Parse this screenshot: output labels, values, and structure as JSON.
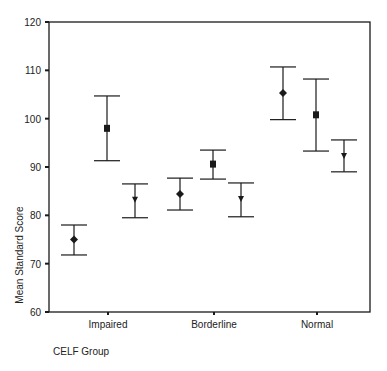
{
  "chart_data": {
    "type": "errorbar",
    "title": "",
    "xlabel": "CELF Group",
    "ylabel": "Mean Standard Score",
    "ylim": [
      60,
      120
    ],
    "yticks": [
      60,
      70,
      80,
      90,
      100,
      110,
      120
    ],
    "grid": false,
    "legend": null,
    "categories": [
      "Impaired",
      "Borderline",
      "Normal"
    ],
    "series": [
      {
        "name": "Series 1 (diamond)",
        "marker": "diamond",
        "mean": [
          75.0,
          84.4,
          105.3
        ],
        "upper": [
          78.0,
          87.7,
          110.7
        ],
        "lower": [
          71.8,
          81.1,
          99.8
        ]
      },
      {
        "name": "Series 2 (square)",
        "marker": "square",
        "mean": [
          98.0,
          90.6,
          100.8
        ],
        "upper": [
          104.7,
          93.5,
          108.2
        ],
        "lower": [
          91.3,
          87.5,
          93.3
        ]
      },
      {
        "name": "Series 3 (triangle)",
        "marker": "triangle-down",
        "mean": [
          83.2,
          83.4,
          92.3
        ],
        "upper": [
          86.5,
          86.7,
          95.6
        ],
        "lower": [
          79.5,
          79.7,
          89.0
        ]
      }
    ]
  },
  "colors": {
    "ink": "#1a1a1a",
    "background": "#ffffff"
  }
}
